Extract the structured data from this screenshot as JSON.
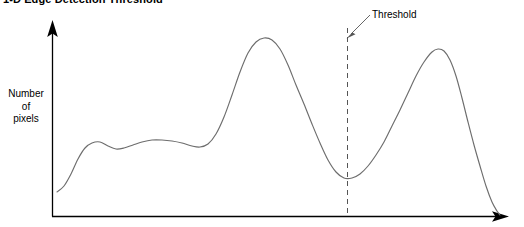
{
  "chart_data": {
    "type": "line",
    "title": "1-D Edge Detection Threshold",
    "xlabel": "",
    "ylabel": "Number of pixels",
    "ylabel_lines": [
      "Number",
      "of",
      "pixels"
    ],
    "grid": false,
    "legend": false,
    "axis_arrows": true,
    "annotations": [
      {
        "name": "threshold",
        "label": "Threshold",
        "style": "dashed-vertical-line-with-leader-arrow",
        "x_pixel": 347,
        "color": "#555555"
      }
    ],
    "series": [
      {
        "name": "pixel-histogram",
        "color": "#6d6d6d",
        "points_pixel": [
          [
            57,
            192
          ],
          [
            64,
            186
          ],
          [
            71,
            174
          ],
          [
            78,
            159
          ],
          [
            85,
            148
          ],
          [
            92,
            143
          ],
          [
            100,
            142
          ],
          [
            108,
            146
          ],
          [
            116,
            149
          ],
          [
            124,
            148
          ],
          [
            133,
            145
          ],
          [
            142,
            142
          ],
          [
            152,
            140
          ],
          [
            162,
            140
          ],
          [
            172,
            141
          ],
          [
            182,
            143
          ],
          [
            192,
            146
          ],
          [
            200,
            147
          ],
          [
            208,
            144
          ],
          [
            216,
            134
          ],
          [
            224,
            117
          ],
          [
            232,
            95
          ],
          [
            240,
            72
          ],
          [
            248,
            53
          ],
          [
            256,
            42
          ],
          [
            264,
            38
          ],
          [
            272,
            40
          ],
          [
            280,
            49
          ],
          [
            288,
            65
          ],
          [
            296,
            85
          ],
          [
            304,
            104
          ],
          [
            312,
            124
          ],
          [
            320,
            143
          ],
          [
            328,
            160
          ],
          [
            336,
            172
          ],
          [
            344,
            178
          ],
          [
            352,
            178
          ],
          [
            360,
            174
          ],
          [
            368,
            166
          ],
          [
            376,
            155
          ],
          [
            384,
            142
          ],
          [
            392,
            126
          ],
          [
            400,
            110
          ],
          [
            408,
            93
          ],
          [
            416,
            76
          ],
          [
            424,
            62
          ],
          [
            432,
            52
          ],
          [
            438,
            49
          ],
          [
            444,
            51
          ],
          [
            450,
            60
          ],
          [
            456,
            76
          ],
          [
            462,
            98
          ],
          [
            468,
            122
          ],
          [
            474,
            145
          ],
          [
            480,
            166
          ],
          [
            486,
            186
          ],
          [
            492,
            202
          ],
          [
            497,
            211
          ],
          [
            500,
            215
          ]
        ]
      }
    ]
  },
  "axes": {
    "origin_pixel": [
      52,
      216
    ],
    "y_axis_top_pixel": 22,
    "x_axis_right_pixel": 508,
    "color": "#000000"
  }
}
